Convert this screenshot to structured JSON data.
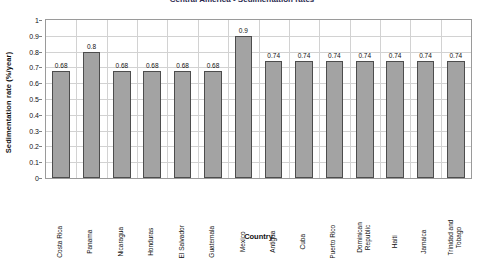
{
  "chart_data": {
    "type": "bar",
    "title": "Central America - Sedimentation rates",
    "xlabel": "Country",
    "ylabel": "Sedimentation rate (%/year)",
    "ylim": [
      0,
      1
    ],
    "ytick_step": 0.1,
    "grid": true,
    "legend": null,
    "bar_color": "#a3a3a3",
    "bar_border_color": "#4d4d4d",
    "categories": [
      "Costa Rica",
      "Panama",
      "Nicaragua",
      "Honduras",
      "El Salvador",
      "Guatemala",
      "Mexico",
      "Antigua",
      "Cuba",
      "Puerto Rico",
      "Dominican Republic",
      "Haiti",
      "Jamaica",
      "Trinidad and Tobago"
    ],
    "values": [
      0.68,
      0.8,
      0.68,
      0.68,
      0.68,
      0.68,
      0.9,
      0.74,
      0.74,
      0.74,
      0.74,
      0.74,
      0.74,
      0.74
    ],
    "value_labels": [
      "0.68",
      "0.8",
      "0.68",
      "0.68",
      "0.68",
      "0.68",
      "0.9",
      "0.74",
      "0.74",
      "0.74",
      "0.74",
      "0.74",
      "0.74",
      "0.74"
    ],
    "ytick_labels": [
      "1",
      "0.9",
      "0.8",
      "0.7",
      "0.6",
      "0.5",
      "0.4",
      "0.3",
      "0.2",
      "0.1",
      "0"
    ],
    "ytick_values": [
      1,
      0.9,
      0.8,
      0.7,
      0.6,
      0.5,
      0.4,
      0.3,
      0.2,
      0.1,
      0
    ]
  }
}
